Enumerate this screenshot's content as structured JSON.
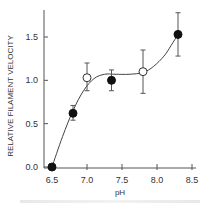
{
  "chart_data": {
    "type": "scatter",
    "title": "",
    "xlabel": "pH",
    "ylabel": "RELATIVE FILAMENT VELOCITY",
    "xlim": [
      6.45,
      8.55
    ],
    "ylim": [
      0.0,
      1.75
    ],
    "x_ticks": [
      6.5,
      7.0,
      7.5,
      8.0,
      8.5
    ],
    "x_tick_labels": [
      "6.5",
      "7.0",
      "7.5",
      "8.0",
      "8.5"
    ],
    "y_ticks": [
      0.0,
      0.5,
      1.0,
      1.5
    ],
    "y_tick_labels": [
      "0.0",
      "0.5",
      "1.0",
      "1.5"
    ],
    "grid": false,
    "series": [
      {
        "name": "filled",
        "marker": "filled-circle",
        "points": [
          {
            "x": 6.5,
            "y": 0.0,
            "err_low": 0.0,
            "err_high": 0.0
          },
          {
            "x": 6.8,
            "y": 0.62,
            "err_low": 0.08,
            "err_high": 0.09
          },
          {
            "x": 7.35,
            "y": 1.0,
            "err_low": 0.12,
            "err_high": 0.12
          },
          {
            "x": 8.3,
            "y": 1.53,
            "err_low": 0.25,
            "err_high": 0.25
          }
        ]
      },
      {
        "name": "open",
        "marker": "open-circle",
        "points": [
          {
            "x": 7.0,
            "y": 1.03,
            "err_low": 0.15,
            "err_high": 0.17
          },
          {
            "x": 7.8,
            "y": 1.1,
            "err_low": 0.25,
            "err_high": 0.25
          }
        ]
      }
    ],
    "fit_curve": {
      "name": "fitted-curve",
      "points": [
        [
          6.5,
          0.0
        ],
        [
          6.65,
          0.35
        ],
        [
          6.8,
          0.65
        ],
        [
          6.95,
          0.88
        ],
        [
          7.1,
          1.02
        ],
        [
          7.25,
          1.07
        ],
        [
          7.4,
          1.07
        ],
        [
          7.6,
          1.07
        ],
        [
          7.8,
          1.09
        ],
        [
          7.95,
          1.16
        ],
        [
          8.1,
          1.28
        ],
        [
          8.2,
          1.4
        ],
        [
          8.3,
          1.53
        ]
      ]
    }
  }
}
